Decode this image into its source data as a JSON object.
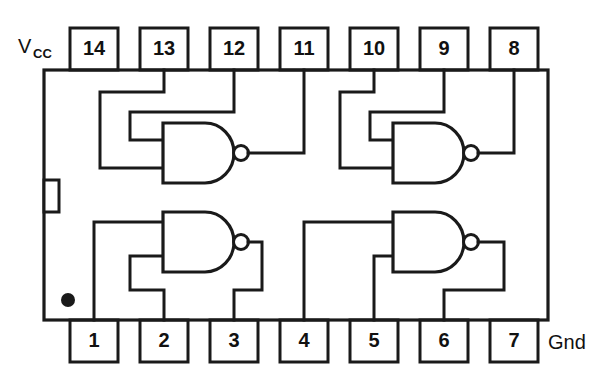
{
  "diagram": {
    "type": "ic-pinout-schematic",
    "device": "quad 2-input NAND gate DIP-14",
    "package_pins": 14,
    "gate_count": 4,
    "stroke_color": "#1a1a1a",
    "background_color": "#ffffff"
  },
  "labels": {
    "vcc_main": "V",
    "vcc_sub": "CC",
    "gnd": "Gnd"
  },
  "top_pins": [
    {
      "number": "14"
    },
    {
      "number": "13"
    },
    {
      "number": "12"
    },
    {
      "number": "11"
    },
    {
      "number": "10"
    },
    {
      "number": "9"
    },
    {
      "number": "8"
    }
  ],
  "bottom_pins": [
    {
      "number": "1"
    },
    {
      "number": "2"
    },
    {
      "number": "3"
    },
    {
      "number": "4"
    },
    {
      "number": "5"
    },
    {
      "number": "6"
    },
    {
      "number": "7"
    }
  ],
  "gates": [
    {
      "name": "gate-top-left",
      "symbol": "NAND",
      "inputs": [
        "13",
        "12"
      ],
      "output": "11"
    },
    {
      "name": "gate-top-right",
      "symbol": "NAND",
      "inputs": [
        "10",
        "9"
      ],
      "output": "8"
    },
    {
      "name": "gate-bottom-left",
      "symbol": "NAND",
      "inputs": [
        "1",
        "2"
      ],
      "output": "3"
    },
    {
      "name": "gate-bottom-right",
      "symbol": "NAND",
      "inputs": [
        "4",
        "5"
      ],
      "output": "6"
    }
  ],
  "markers": {
    "notch": "left-edge-key-notch",
    "dot": "pin1-orientation-dot"
  }
}
